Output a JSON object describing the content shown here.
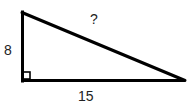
{
  "diagram": {
    "type": "right-triangle",
    "colors": {
      "stroke": "#000000",
      "text": "#222222",
      "background": "#ffffff"
    },
    "vertices": {
      "top": [
        22,
        12
      ],
      "right_angle": [
        22,
        80
      ],
      "right": [
        185,
        80
      ]
    },
    "labels": {
      "vertical_leg": "8",
      "horizontal_leg": "15",
      "hypotenuse": "?"
    },
    "right_angle_marker": true
  }
}
